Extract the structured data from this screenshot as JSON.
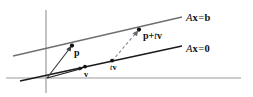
{
  "figure": {
    "kind": "geometric-diagram",
    "width": 253,
    "height": 97,
    "background_color": "#ffffff"
  },
  "colors": {
    "axis": "#9a9a9a",
    "line_axb": "#6f6f6f",
    "line_ax0": "#1a1a1a",
    "vector_arrow": "#3c3c3c",
    "dashed_arrow": "#8e8e8e",
    "point": "#111111",
    "text": "#111111"
  },
  "axes": {
    "vertical": {
      "x": 46,
      "y_top": 10,
      "y_bottom": 93,
      "name": "vertical-axis"
    },
    "horizontal": {
      "y": 78,
      "x_left": 6,
      "x_right": 241,
      "name": "horizontal-axis"
    },
    "origin": {
      "x": 46,
      "y": 78
    }
  },
  "lines": [
    {
      "id": "line-axb",
      "label": "Ax = b",
      "label_parts": {
        "matrix": "A",
        "vector": "x",
        "equals": "=",
        "rhs": "b"
      },
      "x1": 13,
      "y1": 56,
      "x2": 182,
      "y2": 17,
      "stroke": "#6f6f6f",
      "width": 1.3
    },
    {
      "id": "line-ax0",
      "label": "Ax = 0",
      "label_parts": {
        "matrix": "A",
        "vector": "x",
        "equals": "=",
        "rhs": "0"
      },
      "x1": 20,
      "y1": 81,
      "x2": 182,
      "y2": 46,
      "stroke": "#1a1a1a",
      "width": 1.6
    }
  ],
  "points": [
    {
      "id": "point-p",
      "label": "p",
      "x": 72,
      "y": 46,
      "label_x": 74,
      "label_y": 48
    },
    {
      "id": "point-p-tv",
      "label": "p + tv",
      "x": 139,
      "y": 30,
      "label_x": 143,
      "label_y": 31
    },
    {
      "id": "point-v",
      "label": "v",
      "x": 84,
      "y": 67,
      "label_x": 84,
      "label_y": 70
    },
    {
      "id": "point-tv",
      "label": "tv",
      "x": 112,
      "y": 61,
      "label_x": 110,
      "label_y": 63
    }
  ],
  "arrows": [
    {
      "id": "arrow-to-p",
      "from_x": 47,
      "from_y": 78,
      "to_x": 71,
      "to_y": 47,
      "style": "solid",
      "stroke": "#3c3c3c",
      "width": 1.2
    },
    {
      "id": "arrow-to-v",
      "from_x": 47,
      "from_y": 78,
      "to_x": 83,
      "to_y": 68,
      "style": "solid",
      "stroke": "#1a1a1a",
      "width": 1.2
    },
    {
      "id": "arrow-tv-to-ptv",
      "from_x": 112,
      "from_y": 61,
      "to_x": 137,
      "to_y": 32,
      "style": "dashed",
      "stroke": "#8e8e8e",
      "width": 1.2
    }
  ],
  "labels": {
    "axb": {
      "matrix": "A",
      "vector": "x",
      "equals": "=",
      "rhs": "b"
    },
    "ax0": {
      "matrix": "A",
      "vector": "x",
      "equals": "=",
      "rhs": "0"
    },
    "p_tv": {
      "p": "p",
      "plus": "+",
      "t": "t",
      "v": "v"
    },
    "p": {
      "text": "p"
    },
    "v": {
      "text": "v"
    },
    "tv": {
      "t": "t",
      "v": "v"
    }
  }
}
